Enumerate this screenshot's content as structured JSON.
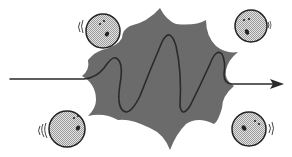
{
  "diagram": {
    "colors": {
      "background": "#ffffff",
      "blob_fill": "#6b6b6b",
      "wave_stroke": "#2a2a2a",
      "face_fill": "#d4d4d4",
      "face_stroke": "#222222",
      "arrow": "#2a2a2a"
    },
    "elements": {
      "blob": "spiky-burst-shape",
      "wave": "incoming-wave-oscillating-through-blob-with-arrow",
      "faces": [
        {
          "position": "top-left",
          "cx": 103,
          "cy": 31,
          "r": 17,
          "shake": "left"
        },
        {
          "position": "top-right",
          "cx": 251,
          "cy": 26,
          "r": 16,
          "shake": "right"
        },
        {
          "position": "bottom-left",
          "cx": 67,
          "cy": 129,
          "r": 18,
          "shake": "left"
        },
        {
          "position": "bottom-right",
          "cx": 249,
          "cy": 129,
          "r": 17,
          "shake": "right"
        }
      ]
    }
  }
}
